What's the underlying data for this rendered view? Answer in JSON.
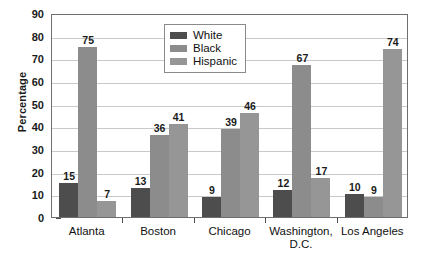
{
  "chart_data": {
    "type": "bar",
    "title": "",
    "xlabel": "",
    "ylabel": "Percentage",
    "ylim": [
      0,
      90
    ],
    "ytick_step": 10,
    "yticks": [
      90,
      80,
      70,
      60,
      50,
      40,
      30,
      20,
      10,
      0
    ],
    "grid": true,
    "legend_position": "top-center",
    "categories": [
      "Atlanta",
      "Boston",
      "Chicago",
      "Washington,\nD.C.",
      "Los Angeles"
    ],
    "series": [
      {
        "name": "White",
        "color": "#4d4d4d",
        "values": [
          15,
          13,
          9,
          12,
          10
        ]
      },
      {
        "name": "Black",
        "color": "#8c8c8c",
        "values": [
          75,
          36,
          39,
          67,
          9
        ]
      },
      {
        "name": "Hispanic",
        "color": "#969696",
        "values": [
          7,
          41,
          46,
          17,
          74
        ]
      }
    ]
  },
  "legend": {
    "items": [
      {
        "label": "White",
        "color": "#4d4d4d"
      },
      {
        "label": "Black",
        "color": "#8c8c8c"
      },
      {
        "label": "Hispanic",
        "color": "#969696"
      }
    ]
  },
  "caption": {
    "fragment": ""
  }
}
